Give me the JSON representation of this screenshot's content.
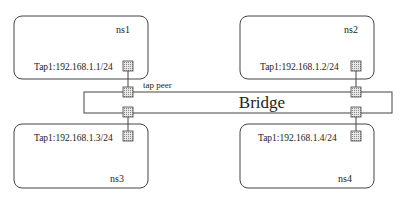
{
  "namespaces": [
    {
      "name": "ns1",
      "tap_label": "Tap1:192.168.1.1/24"
    },
    {
      "name": "ns2",
      "tap_label": "Tap1:192.168.1.2/24"
    },
    {
      "name": "ns3",
      "tap_label": "Tap1:192.168.1.3/24"
    },
    {
      "name": "ns4",
      "tap_label": "Tap1:192.168.1.4/24"
    }
  ],
  "bridge": {
    "label": "Bridge"
  },
  "peer_label": "tap peer"
}
